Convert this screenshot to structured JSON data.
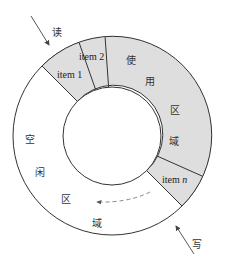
{
  "diagram": {
    "type": "circular-buffer",
    "colors": {
      "used_fill": "#dedede",
      "free_fill": "#ffffff",
      "stroke": "#333333",
      "arrow": "#444444",
      "dashed_arrow": "#777777"
    },
    "read_pointer": {
      "label": "读"
    },
    "write_pointer": {
      "label": "写"
    },
    "items": [
      {
        "label": "item 1"
      },
      {
        "label": "item 2"
      },
      {
        "label": "item n",
        "label_prefix": "item ",
        "label_var": "n"
      }
    ],
    "used_region": {
      "chars": [
        "使",
        "用",
        "区",
        "域"
      ]
    },
    "free_region": {
      "chars": [
        "空",
        "闲",
        "区",
        "域"
      ]
    }
  }
}
